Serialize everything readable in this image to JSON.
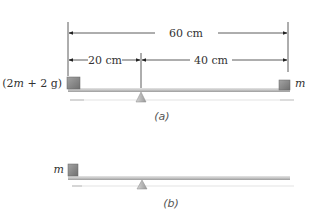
{
  "dimensions": {
    "total_label": "60 cm",
    "left_label": "20 cm",
    "right_label": "40 cm"
  },
  "part_a": {
    "caption": "(a)",
    "left_mass_label": "(2m + 2 g)",
    "right_mass_label": "m"
  },
  "part_b": {
    "caption": "(b)",
    "mass_label": "m"
  },
  "colors": {
    "block": "#8a8a8a",
    "bar": "#c8c8c8",
    "fulcrum": "#bdbdbd",
    "dim_line": "#222222"
  }
}
